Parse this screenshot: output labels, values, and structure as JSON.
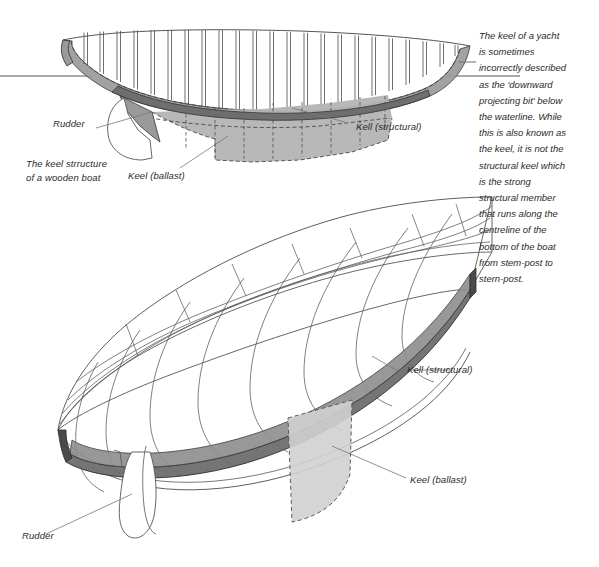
{
  "figure": {
    "title_caption": "The keel strructure\nof a wooden boat",
    "caption_line1": "The keel strructure",
    "caption_line2": "of a wooden boat"
  },
  "note": {
    "lines": [
      "The keel of a yacht",
      "is sometimes",
      "incorrectly described",
      "as the 'downward",
      "projecting bit' below",
      "the waterline. While",
      "this is also known as",
      "the keel, it is not the",
      "structural keel which",
      "is the strong",
      "structural member",
      "that runs along the",
      "centreline of the",
      "bottom of the boat",
      "from stem-post to",
      "stern-post."
    ]
  },
  "labels": {
    "upper_rudder": "Rudder",
    "upper_keel_structural": "Kell (structural)",
    "upper_keel_ballast": "Keel (ballast)",
    "lower_keel_structural": "Kell (structural)",
    "lower_keel_ballast": "Keel (ballast)",
    "lower_rudder": "Rudder"
  },
  "colors": {
    "line": "#555555",
    "line_dark": "#333333",
    "hull_fill": "#9a9a9a",
    "ballast_fill": "#b4b4b4",
    "ballast_fill_light": "#d0d0d0",
    "keel_strip_dark": "#6e6e6e",
    "keel_strip_mid": "#8d8d8d",
    "text": "#2b2b2b",
    "background": "#ffffff"
  }
}
